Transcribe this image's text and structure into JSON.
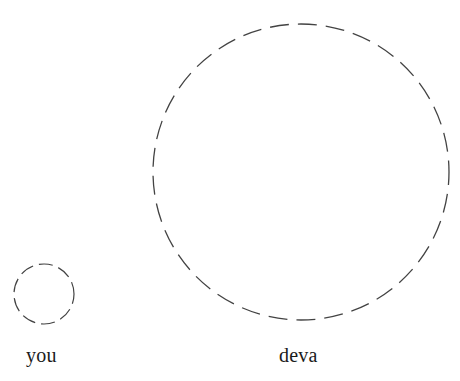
{
  "figure": {
    "background_color": "#ffffff",
    "stroke_color": "#434343",
    "label_color": "#1b1b1b",
    "width": 460,
    "height": 381
  },
  "chart_data": {
    "type": "scatter",
    "title": "",
    "subtitle": "",
    "xlabel": "",
    "ylabel": "",
    "grid": false,
    "legend": "none",
    "shape": "circle",
    "line_style": "dashed",
    "annotations": [
      "you",
      "deva"
    ],
    "items": [
      {
        "label": "you",
        "center_x": 44,
        "center_y": 294,
        "diameter": 60,
        "radius": 30,
        "stroke_width": 1.2,
        "dash_length": 14,
        "gap_length": 6,
        "label_x": 26,
        "label_y": 345
      },
      {
        "label": "deva",
        "center_x": 301,
        "center_y": 172,
        "diameter": 296,
        "radius": 148,
        "stroke_width": 1.3,
        "dash_length": 19,
        "gap_length": 9,
        "label_x": 279,
        "label_y": 345
      }
    ]
  },
  "labels": {
    "small_circle": "you",
    "large_circle": "deva"
  }
}
